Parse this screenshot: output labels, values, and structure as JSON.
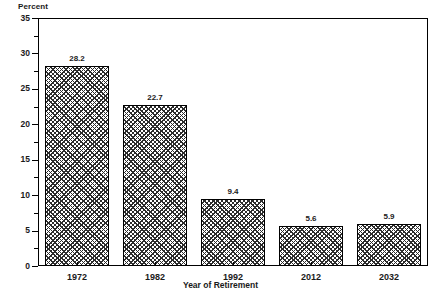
{
  "chart_data": {
    "type": "bar",
    "title": "",
    "categories": [
      "1972",
      "1982",
      "1992",
      "2012",
      "2032"
    ],
    "values": [
      28.2,
      22.7,
      9.4,
      5.6,
      5.9
    ],
    "value_labels": [
      "28.2",
      "22.7",
      "9.4",
      "5.6",
      "5.9"
    ],
    "xlabel": "Year of Retirement",
    "ylabel": "Percent",
    "ylim": [
      0,
      35
    ],
    "ytick_labels": [
      "0",
      "5",
      "10",
      "15",
      "20",
      "25",
      "30",
      "35"
    ],
    "ytick_values": [
      0,
      5,
      10,
      15,
      20,
      25,
      30,
      35
    ],
    "yminor_values": [
      2.5,
      7.5,
      12.5,
      17.5,
      22.5,
      27.5,
      32.5
    ],
    "grid": false,
    "legend": null,
    "series_fill": "cross-hatch",
    "colors": {
      "axis": "#000000",
      "text": "#1a1a1a",
      "bar_hatch": "#2b2b2b",
      "bar_background": "#ffffff"
    }
  },
  "axis_unit_label": "Percent"
}
